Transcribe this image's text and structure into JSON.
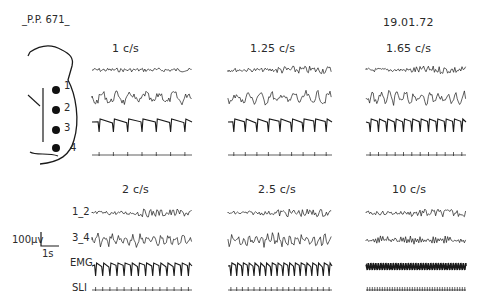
{
  "figure": {
    "subject_id": "_P.P. 671_",
    "date": "19.01.72",
    "scale_bar": {
      "amplitude": "100µv",
      "time": "1s"
    },
    "electrode_diagram": {
      "electrodes": [
        "1",
        "2",
        "3",
        "4"
      ]
    },
    "channel_labels": [
      "1_2",
      "3_4",
      "EMG",
      "SLI"
    ],
    "panels": [
      {
        "label": "1 c/s"
      },
      {
        "label": "1.25 c/s"
      },
      {
        "label": "1.65 c/s"
      },
      {
        "label": "2 c/s"
      },
      {
        "label": "2.5 c/s"
      },
      {
        "label": "10 c/s"
      }
    ]
  },
  "chart_data": {
    "type": "line",
    "subject": "P.P. 671",
    "date": "19.01.72",
    "channels": [
      "1_2",
      "3_4",
      "EMG",
      "SLI"
    ],
    "stimulation_frequencies_cps": [
      1,
      1.25,
      1.65,
      2,
      2.5,
      10
    ],
    "panel_labels": [
      "1 c/s",
      "1.25 c/s",
      "1.65 c/s",
      "2 c/s",
      "2.5 c/s",
      "10 c/s"
    ],
    "scale": {
      "amplitude_uV": 100,
      "time_s": 1
    },
    "layout": {
      "rows": 2,
      "cols": 3,
      "grid": false,
      "legend": "none"
    }
  }
}
